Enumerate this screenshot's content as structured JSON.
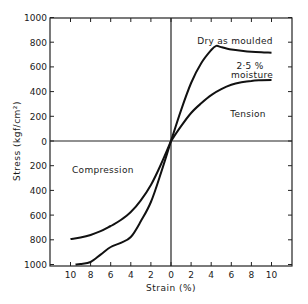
{
  "chart_data": {
    "type": "line",
    "title": "",
    "xlabel": "Strain (%)",
    "ylabel": "Stress (kgf/cm²)",
    "x_tick_labels": [
      "10",
      "8",
      "6",
      "4",
      "2",
      "0",
      "2",
      "4",
      "6",
      "8",
      "10"
    ],
    "y_tick_labels": [
      "1000",
      "800",
      "600",
      "400",
      "200",
      "0",
      "200",
      "400",
      "600",
      "800",
      "1000"
    ],
    "xlim": [
      -12,
      12
    ],
    "ylim": [
      -1000,
      1000
    ],
    "grid": false,
    "legend": null,
    "annotations": [
      {
        "text": "Dry as moulded",
        "region": "tension"
      },
      {
        "text": "2·5 %",
        "region": "tension"
      },
      {
        "text": "moisture",
        "region": "tension"
      },
      {
        "text": "Tension",
        "region": "upper-right quadrant"
      },
      {
        "text": "Compression",
        "region": "lower-left quadrant"
      }
    ],
    "series": [
      {
        "name": "Dry as moulded (tension)",
        "x": [
          0,
          1,
          2,
          3,
          4,
          4.5,
          5,
          6,
          7,
          8,
          9,
          10
        ],
        "y": [
          0,
          250,
          470,
          630,
          737,
          770,
          760,
          740,
          730,
          722,
          718,
          715
        ]
      },
      {
        "name": "2·5 % moisture (tension)",
        "x": [
          0,
          1,
          2,
          3,
          4,
          5,
          6,
          7,
          8,
          9,
          10
        ],
        "y": [
          0,
          120,
          227,
          305,
          372,
          420,
          455,
          475,
          487,
          492,
          494
        ]
      },
      {
        "name": "Dry as moulded (compression)",
        "x": [
          0,
          -1,
          -2,
          -3,
          -4,
          -5,
          -6,
          -7,
          -8,
          -9,
          -9.5
        ],
        "y": [
          0,
          -260,
          -494,
          -650,
          -777,
          -825,
          -858,
          -920,
          -980,
          -995,
          -1000
        ]
      },
      {
        "name": "2·5 % moisture (compression)",
        "x": [
          0,
          -1,
          -2,
          -3,
          -4,
          -5,
          -6,
          -7,
          -8,
          -9,
          -10
        ],
        "y": [
          0,
          -190,
          -356,
          -480,
          -575,
          -640,
          -688,
          -730,
          -761,
          -782,
          -794
        ]
      }
    ]
  }
}
